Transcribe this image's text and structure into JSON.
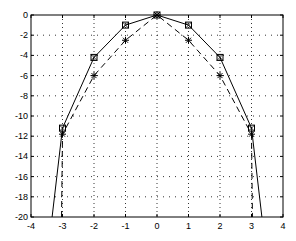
{
  "chart_data": {
    "type": "line",
    "title": "",
    "xlabel": "",
    "ylabel": "",
    "xlim": [
      -4,
      4
    ],
    "ylim": [
      -20,
      0
    ],
    "grid": true,
    "legend": null,
    "x_ticks": [
      -4,
      -3,
      -2,
      -1,
      0,
      1,
      2,
      3,
      4
    ],
    "y_ticks": [
      0,
      -2,
      -4,
      -6,
      -8,
      -10,
      -12,
      -14,
      -16,
      -18,
      -20
    ],
    "series": [
      {
        "name": "solid-square-x",
        "style": "solid",
        "marker": "square-x",
        "color": "#000000",
        "x": [
          -3.33,
          -3,
          -2,
          -1,
          0,
          1,
          2,
          3,
          3.33
        ],
        "y": [
          -20,
          -11.2,
          -4.2,
          -1,
          0,
          -1,
          -4.2,
          -11.2,
          -20
        ],
        "marker_indices": [
          1,
          2,
          3,
          4,
          5,
          6,
          7
        ]
      },
      {
        "name": "dashed-asterisk",
        "style": "dashed",
        "marker": "asterisk",
        "color": "#000000",
        "x": [
          -3.03,
          -3,
          -2,
          -1,
          0,
          1,
          2,
          3,
          3.03
        ],
        "y": [
          -20,
          -11.8,
          -6,
          -2.5,
          0,
          -2.5,
          -6,
          -11.8,
          -20
        ],
        "marker_indices": [
          1,
          2,
          3,
          4,
          5,
          6,
          7
        ]
      }
    ]
  },
  "plot_area": {
    "left": 31,
    "top": 15,
    "right": 283,
    "bottom": 217
  }
}
